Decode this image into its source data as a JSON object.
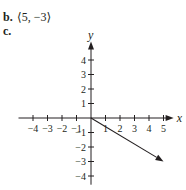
{
  "part_b": {
    "label": "b.",
    "expression": "⟨5, −3⟩"
  },
  "part_c": {
    "label": "c."
  },
  "chart_data": {
    "type": "vector-plot",
    "xlabel": "x",
    "ylabel": "y",
    "xlim": [
      -5,
      5.7
    ],
    "ylim": [
      -4.6,
      5.2
    ],
    "x_ticks": [
      -4,
      -3,
      -2,
      -1,
      1,
      2,
      3,
      4,
      5
    ],
    "y_ticks": [
      -4,
      -3,
      -2,
      -1,
      1,
      2,
      3,
      4
    ],
    "x_tick_labels": [
      "−4",
      "−3",
      "−2",
      "−1",
      "1",
      "2",
      "3",
      "4",
      "5"
    ],
    "y_tick_labels": [
      "−4",
      "−3",
      "−2",
      "−1",
      "1",
      "2",
      "3",
      "4"
    ],
    "vectors": [
      {
        "from": [
          0,
          0
        ],
        "to": [
          5,
          -3
        ]
      }
    ],
    "grid": false,
    "colors": {
      "ink": "#231f20"
    }
  }
}
